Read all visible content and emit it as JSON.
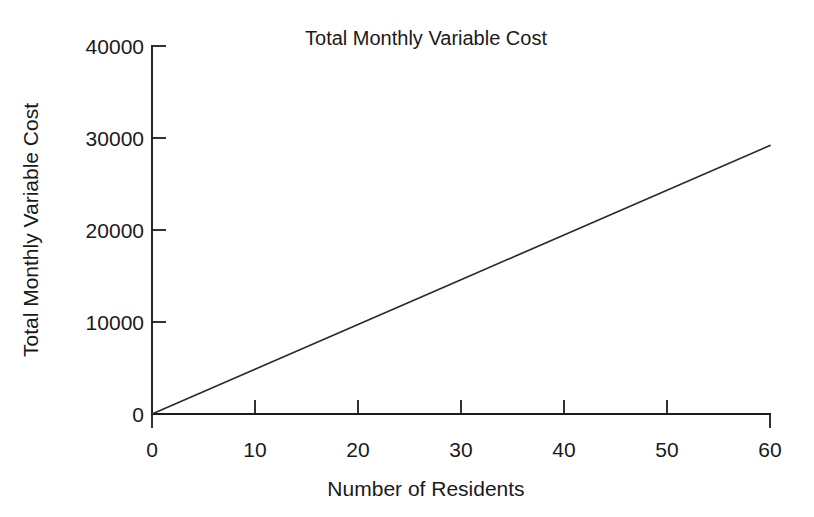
{
  "chart_data": {
    "type": "line",
    "title": "Total Monthly Variable Cost",
    "xlabel": "Number of Residents",
    "ylabel": "Total Monthly Variable Cost",
    "xlim": [
      0,
      60
    ],
    "ylim": [
      0,
      40000
    ],
    "xticks": [
      0,
      10,
      20,
      30,
      40,
      50,
      60
    ],
    "yticks": [
      0,
      10000,
      20000,
      30000,
      40000
    ],
    "xtick_labels": [
      "0",
      "10",
      "20",
      "30",
      "40",
      "50",
      "60"
    ],
    "ytick_labels": [
      "0",
      "10000",
      "20000",
      "30000",
      "40000"
    ],
    "grid": false,
    "legend": false,
    "series": [
      {
        "name": "Total Monthly Variable Cost",
        "color": "#2b2b2b",
        "x": [
          0,
          10,
          20,
          30,
          40,
          50,
          60
        ],
        "values": [
          0,
          4865,
          9730,
          14595,
          19460,
          24325,
          29190
        ]
      }
    ],
    "annotations": []
  },
  "labels": {
    "title": "Total Monthly Variable Cost",
    "x_axis_title": "Number of Residents",
    "y_axis_title": "Total Monthly Variable Cost",
    "y_40000": "40000",
    "y_30000": "30000",
    "y_20000": "20000",
    "y_10000": "10000",
    "y_0": "0",
    "x_0": "0",
    "x_10": "10",
    "x_20": "20",
    "x_30": "30",
    "x_40": "40",
    "x_50": "50",
    "x_60": "60"
  },
  "colors": {
    "background": "#ffffff",
    "axis": "#1c1c1c",
    "series": "#2b2b2b",
    "text": "#1a1a1a"
  }
}
